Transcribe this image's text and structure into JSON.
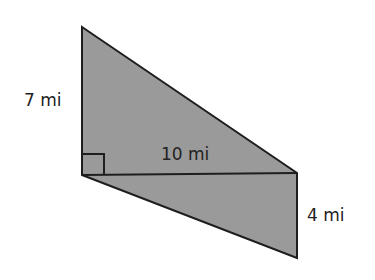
{
  "diagram": {
    "type": "composite-figure",
    "colors": {
      "fill": "#9a9a9a",
      "stroke": "#1e1e1e",
      "text": "#222222",
      "background": "#ffffff"
    },
    "vertices": {
      "top": [
        82,
        27
      ],
      "left": [
        82,
        175
      ],
      "right_mid": [
        297,
        173
      ],
      "bottom_right": [
        297,
        258
      ]
    },
    "labels": {
      "left_side": "7 mi",
      "base": "10 mi",
      "right_side": "4 mi"
    },
    "right_angle_marker": {
      "at": "left",
      "size": 21
    }
  }
}
